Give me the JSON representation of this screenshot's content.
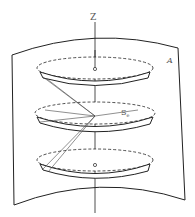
{
  "diagram": {
    "labels": {
      "axis": "Z",
      "surface": "A",
      "point": "S",
      "point_subscript": "e"
    },
    "colors": {
      "stroke": "#222222",
      "label": "#555555",
      "background": "#ffffff"
    },
    "discs": [
      {
        "name": "top-disc",
        "cy": 70
      },
      {
        "name": "middle-disc",
        "cy": 115
      },
      {
        "name": "bottom-disc",
        "cy": 160
      }
    ]
  }
}
